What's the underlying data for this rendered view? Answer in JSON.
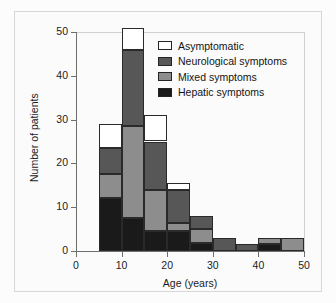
{
  "chart_data": {
    "type": "bar",
    "subtype": "stacked-histogram",
    "title": "",
    "xlabel": "Age (years)",
    "ylabel": "Number of patients",
    "xlim": [
      0,
      50
    ],
    "ylim": [
      0,
      50
    ],
    "xticks": [
      0,
      10,
      20,
      30,
      40,
      50
    ],
    "yticks": [
      0,
      10,
      20,
      30,
      40,
      50
    ],
    "grid": false,
    "legend_position": "top-right",
    "bin_width": 5,
    "categories": [
      "5-10",
      "10-15",
      "15-20",
      "20-25",
      "25-30",
      "30-35",
      "35-40",
      "40-45",
      "45-50"
    ],
    "bin_starts": [
      5,
      10,
      15,
      20,
      25,
      30,
      35,
      40,
      45
    ],
    "series": [
      {
        "name": "Hepatic symptoms",
        "color": "#1a1a1a",
        "values": [
          12,
          7.5,
          4.5,
          4.5,
          1.8,
          0,
          0,
          1.5,
          0
        ]
      },
      {
        "name": "Mixed symptoms",
        "color": "#8d8d8d",
        "values": [
          5.5,
          21,
          9.5,
          1.8,
          3.2,
          0,
          0,
          1.5,
          3
        ]
      },
      {
        "name": "Neurological symptoms",
        "color": "#575757",
        "values": [
          6,
          17.5,
          11,
          7.7,
          3,
          3,
          1.5,
          0,
          0
        ]
      },
      {
        "name": "Asymptomatic",
        "color": "#ffffff",
        "values": [
          5.5,
          5,
          6,
          1.5,
          0,
          0,
          0,
          0,
          0
        ]
      }
    ],
    "totals": [
      29,
      51,
      31,
      15.5,
      8,
      3,
      1.5,
      3,
      3
    ]
  },
  "axes": {
    "y_label": "Number of patients",
    "x_label": "Age (years)",
    "y_ticks": [
      "0",
      "10",
      "20",
      "30",
      "40",
      "50"
    ],
    "x_ticks": [
      "0",
      "10",
      "20",
      "30",
      "40",
      "50"
    ]
  },
  "legend": {
    "items": [
      {
        "label": "Asymptomatic",
        "color": "#ffffff"
      },
      {
        "label": "Neurological symptoms",
        "color": "#575757"
      },
      {
        "label": "Mixed symptoms",
        "color": "#8d8d8d"
      },
      {
        "label": "Hepatic symptoms",
        "color": "#1a1a1a"
      }
    ]
  }
}
